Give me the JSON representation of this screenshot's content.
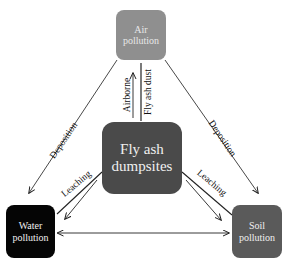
{
  "nodes": {
    "air": {
      "line1": "Air",
      "line2": "pollution",
      "color": "#8f8f8f"
    },
    "fly_ash": {
      "line1": "Fly ash",
      "line2": "dumpsites",
      "color": "#4a4a4a"
    },
    "water": {
      "line1": "Water",
      "line2": "pollution",
      "color": "#050505"
    },
    "soil": {
      "line1": "Soil",
      "line2": "pollution",
      "color": "#5a5a5a"
    }
  },
  "edges": {
    "deposition_left": "Deposition",
    "deposition_right": "Deposition",
    "airborne": "Airborne",
    "fly_ash_dust": "Fly ash dust",
    "leaching_left": "Leaching",
    "leaching_right": "Leaching"
  }
}
